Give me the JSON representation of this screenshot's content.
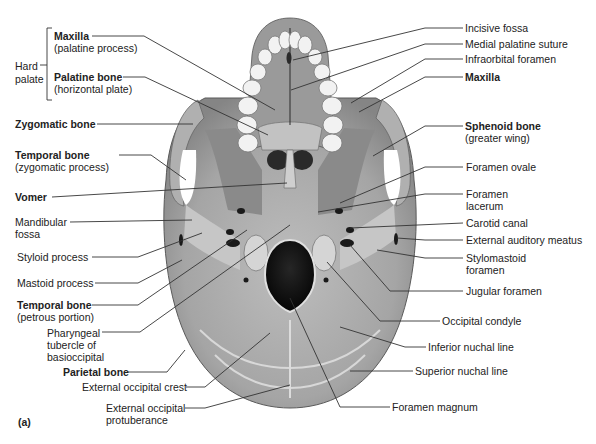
{
  "figure": {
    "panel_label": "(a)",
    "colors": {
      "background": "#ffffff",
      "bone_light": "#c9c9c9",
      "bone_mid": "#9c9c9c",
      "bone_dark": "#6e6e6e",
      "foramen": "#0d0d0d",
      "teeth": "#f2f2f2",
      "leader_line": "#333333",
      "text": "#222222"
    },
    "bracket_group": {
      "label_line1": "Hard",
      "label_line2": "palate"
    },
    "left_labels": [
      {
        "id": "maxilla-palatine",
        "title": "Maxilla",
        "sub": "(palatine process)",
        "bold": true
      },
      {
        "id": "palatine-bone",
        "title": "Palatine bone",
        "sub": "(horizontal plate)",
        "bold": true
      },
      {
        "id": "zygomatic-bone",
        "title": "Zygomatic bone",
        "sub": "",
        "bold": true
      },
      {
        "id": "temporal-zygomatic",
        "title": "Temporal bone",
        "sub": "(zygomatic process)",
        "bold": true
      },
      {
        "id": "vomer",
        "title": "Vomer",
        "sub": "",
        "bold": true
      },
      {
        "id": "mandibular-fossa",
        "title": "Mandibular",
        "sub": "fossa",
        "bold": false
      },
      {
        "id": "styloid-process",
        "title": "Styloid process",
        "sub": "",
        "bold": false
      },
      {
        "id": "mastoid-process",
        "title": "Mastoid process",
        "sub": "",
        "bold": false
      },
      {
        "id": "temporal-petrous",
        "title": "Temporal bone",
        "sub": "(petrous portion)",
        "bold": true
      },
      {
        "id": "pharyngeal-tubercle",
        "title": "Pharyngeal",
        "sub": "tubercle of",
        "sub2": "basioccipital",
        "bold": false
      },
      {
        "id": "parietal-bone",
        "title": "Parietal bone",
        "sub": "",
        "bold": true
      },
      {
        "id": "ext-occipital-crest",
        "title": "External occipital crest",
        "sub": "",
        "bold": false
      },
      {
        "id": "ext-occipital-protuberance",
        "title": "External occipital",
        "sub": "protuberance",
        "bold": false
      }
    ],
    "right_labels": [
      {
        "id": "incisive-fossa",
        "title": "Incisive fossa",
        "sub": "",
        "bold": false
      },
      {
        "id": "medial-palatine-suture",
        "title": "Medial palatine suture",
        "sub": "",
        "bold": false
      },
      {
        "id": "infraorbital-foramen",
        "title": "Infraorbital foramen",
        "sub": "",
        "bold": false
      },
      {
        "id": "maxilla-right",
        "title": "Maxilla",
        "sub": "",
        "bold": true
      },
      {
        "id": "sphenoid-bone",
        "title": "Sphenoid bone",
        "sub": "(greater wing)",
        "bold": true
      },
      {
        "id": "foramen-ovale",
        "title": "Foramen ovale",
        "sub": "",
        "bold": false
      },
      {
        "id": "foramen-lacerum",
        "title": "Foramen",
        "sub": "lacerum",
        "bold": false
      },
      {
        "id": "carotid-canal",
        "title": "Carotid canal",
        "sub": "",
        "bold": false
      },
      {
        "id": "external-auditory-meatus",
        "title": "External auditory meatus",
        "sub": "",
        "bold": false
      },
      {
        "id": "stylomastoid-foramen",
        "title": "Stylomastoid",
        "sub": "foramen",
        "bold": false
      },
      {
        "id": "jugular-foramen",
        "title": "Jugular foramen",
        "sub": "",
        "bold": false
      },
      {
        "id": "occipital-condyle",
        "title": "Occipital condyle",
        "sub": "",
        "bold": false
      },
      {
        "id": "inferior-nuchal-line",
        "title": "Inferior nuchal line",
        "sub": "",
        "bold": false
      },
      {
        "id": "superior-nuchal-line",
        "title": "Superior nuchal line",
        "sub": "",
        "bold": false
      },
      {
        "id": "foramen-magnum",
        "title": "Foramen magnum",
        "sub": "",
        "bold": false
      }
    ]
  }
}
